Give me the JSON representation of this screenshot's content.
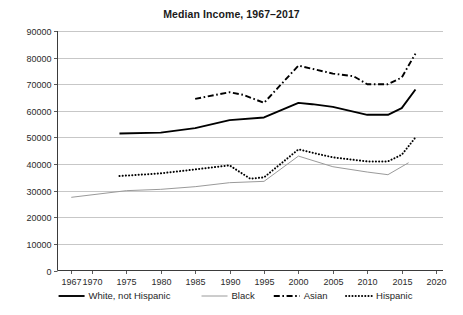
{
  "chart_data": {
    "type": "line",
    "title": "Median Income, 1967–2017",
    "xlabel": "",
    "ylabel": "",
    "xlim": [
      1965,
      2021
    ],
    "ylim": [
      0,
      90000
    ],
    "grid": true,
    "legend_position": "bottom",
    "xticks": [
      "1967",
      "1970",
      "1975",
      "1980",
      "1985",
      "1990",
      "1995",
      "2000",
      "2005",
      "2010",
      "2015",
      "2020"
    ],
    "xtick_values": [
      1967,
      1970,
      1975,
      1980,
      1985,
      1990,
      1995,
      2000,
      2005,
      2010,
      2015,
      2020
    ],
    "yticks": [
      "0",
      "10000",
      "20000",
      "30000",
      "40000",
      "50000",
      "60000",
      "70000",
      "80000",
      "90000"
    ],
    "ytick_values": [
      0,
      10000,
      20000,
      30000,
      40000,
      50000,
      60000,
      70000,
      80000,
      90000
    ],
    "series": [
      {
        "name": "White, not Hispanic",
        "style": "solid",
        "color": "#000000",
        "width": 1.9,
        "x": [
          1974,
          1980,
          1985,
          1990,
          1995,
          2000,
          2002,
          2005,
          2010,
          2013,
          2015,
          2017
        ],
        "values": [
          51500,
          51800,
          53500,
          56500,
          57500,
          63000,
          62500,
          61500,
          58500,
          58500,
          61000,
          68000
        ]
      },
      {
        "name": "Black",
        "style": "solid",
        "color": "#9a9a9a",
        "width": 1.0,
        "x": [
          1967,
          1975,
          1980,
          1985,
          1990,
          1995,
          2000,
          2005,
          2010,
          2013,
          2016
        ],
        "values": [
          27500,
          30000,
          30500,
          31500,
          33000,
          33500,
          43000,
          39000,
          37000,
          36000,
          40500
        ]
      },
      {
        "name": "Asian",
        "style": "dashdot",
        "color": "#000000",
        "width": 1.9,
        "x": [
          1985,
          1988,
          1990,
          1992,
          1995,
          2000,
          2005,
          2008,
          2010,
          2013,
          2015,
          2017
        ],
        "values": [
          64500,
          66000,
          67000,
          66000,
          63000,
          77000,
          74000,
          73000,
          70000,
          70000,
          72500,
          81500
        ]
      },
      {
        "name": "Hispanic",
        "style": "dotted",
        "color": "#000000",
        "width": 2.0,
        "x": [
          1974,
          1980,
          1985,
          1990,
          1993,
          1995,
          2000,
          2005,
          2010,
          2013,
          2015,
          2017
        ],
        "values": [
          35500,
          36500,
          38000,
          39500,
          34500,
          35000,
          45500,
          42500,
          41000,
          41000,
          43500,
          50000
        ]
      }
    ]
  },
  "legend": {
    "items": [
      {
        "label": "White, not Hispanic",
        "swatch": "solid-thick-black"
      },
      {
        "label": "Black",
        "swatch": "solid-thin-gray"
      },
      {
        "label": "Asian",
        "swatch": "dashdot-black"
      },
      {
        "label": "Hispanic",
        "swatch": "dotted-black"
      }
    ]
  }
}
